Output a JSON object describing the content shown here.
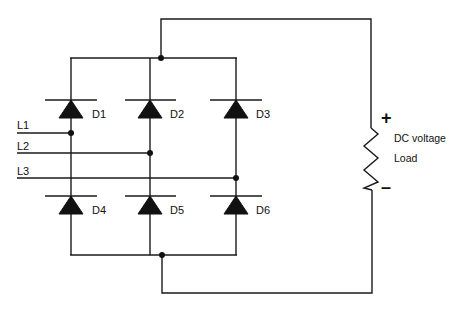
{
  "diagram": {
    "colors": {
      "wire": "#1a1a1a",
      "background": "#ffffff",
      "text": "#111111"
    },
    "inputs": [
      {
        "id": "L1",
        "label": "L1"
      },
      {
        "id": "L2",
        "label": "L2"
      },
      {
        "id": "L3",
        "label": "L3"
      }
    ],
    "diodes": [
      {
        "id": "D1",
        "label": "D1",
        "position": "upper-left"
      },
      {
        "id": "D2",
        "label": "D2",
        "position": "upper-middle"
      },
      {
        "id": "D3",
        "label": "D3",
        "position": "upper-right"
      },
      {
        "id": "D4",
        "label": "D4",
        "position": "lower-left"
      },
      {
        "id": "D5",
        "label": "D5",
        "position": "lower-middle"
      },
      {
        "id": "D6",
        "label": "D6",
        "position": "lower-right"
      }
    ],
    "load": {
      "line1": "DC voltage",
      "line2": "Load",
      "plus": "+",
      "minus": "–"
    }
  }
}
